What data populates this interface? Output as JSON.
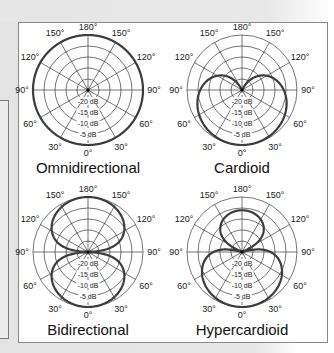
{
  "figure": {
    "plots": [
      {
        "id": "omni",
        "title": "Omnidirectional",
        "cx": 88,
        "cy": 90,
        "pattern": "omnidirectional"
      },
      {
        "id": "cardioid",
        "title": "Cardioid",
        "cx": 242,
        "cy": 90,
        "pattern": "cardioid"
      },
      {
        "id": "bidirectional",
        "title": "Bidirectional",
        "cx": 88,
        "cy": 252,
        "pattern": "bidirectional"
      },
      {
        "id": "hypercardioid",
        "title": "Hypercardioid",
        "cx": 242,
        "cy": 252,
        "pattern": "hypercardioid"
      }
    ],
    "radius": 55,
    "angle_labels": {
      "top": "180°",
      "upper_left": "150°",
      "upper_right": "150°",
      "mid_upper_left": "120°",
      "mid_upper_right": "120°",
      "left": "90°",
      "right": "90°",
      "mid_lower_left": "60°",
      "mid_lower_right": "60°",
      "lower_left": "30°",
      "lower_right": "30°",
      "bottom": "0°"
    },
    "db_rings": [
      "-20 dB",
      "-15 dB",
      "-10 dB",
      "-5 dB"
    ],
    "db_ring_values": [
      -20,
      -15,
      -10,
      -5,
      0
    ],
    "db_floor": -25,
    "colors": {
      "grid": "#3a3a3a",
      "curve": "#3c3c3c",
      "frame": "#8a8a8a",
      "background": "#e4e4e4"
    }
  }
}
